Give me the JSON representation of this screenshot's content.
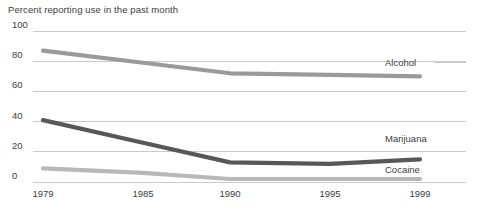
{
  "chart_data": {
    "type": "line",
    "title": "Percent reporting use in the past month",
    "xlabel": "",
    "ylabel": "",
    "x": [
      1979,
      1985,
      1990,
      1995,
      1999
    ],
    "categories": [
      "1979",
      "1985",
      "1990",
      "1995",
      "1999"
    ],
    "xlim": [
      1979,
      1999
    ],
    "ylim": [
      0,
      100
    ],
    "yticks": [
      0,
      20,
      40,
      60,
      80,
      100
    ],
    "ytick_labels": [
      "0",
      "20",
      "40",
      "60",
      "80",
      "100"
    ],
    "xtick_labels": [
      "1979",
      "1985",
      "1990",
      "1995",
      "1999"
    ],
    "grid": true,
    "grid_axis": "y",
    "legend": "inline-right-labels",
    "series": [
      {
        "name": "Alcohol",
        "color": "#9a9a9a",
        "values": [
          87,
          79,
          72,
          71,
          70
        ]
      },
      {
        "name": "Marijuana",
        "color": "#585858",
        "values": [
          41,
          26,
          13,
          12,
          15
        ]
      },
      {
        "name": "Cocaine",
        "color": "#b8b8b8",
        "values": [
          9,
          6,
          2,
          2,
          2
        ]
      }
    ]
  },
  "colors": {
    "gridline": "#c9c9c9",
    "axis_text": "#3d3d3d",
    "background": "#ffffff",
    "alcohol": "#9a9a9a",
    "marijuana": "#585858",
    "cocaine": "#b8b8b8"
  },
  "labels": {
    "title": "Percent reporting use in the past month",
    "series_alcohol": "Alcohol",
    "series_marijuana": "Marijuana",
    "series_cocaine": "Cocaine"
  }
}
